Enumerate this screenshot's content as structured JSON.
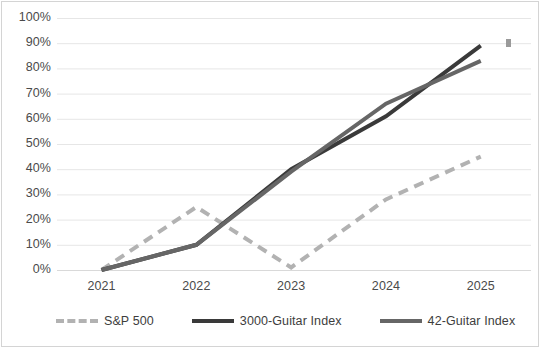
{
  "chart_data": {
    "type": "line",
    "title": "",
    "subtitle": "",
    "xlabel": "",
    "ylabel": "",
    "categories": [
      "2021",
      "2022",
      "2023",
      "2024",
      "2025"
    ],
    "ylim": [
      0,
      100
    ],
    "yticks": [
      "0%",
      "10%",
      "20%",
      "30%",
      "40%",
      "50%",
      "60%",
      "70%",
      "80%",
      "90%",
      "100%"
    ],
    "ytick_values": [
      0,
      10,
      20,
      30,
      40,
      50,
      60,
      70,
      80,
      90,
      100
    ],
    "grid": true,
    "legend_position": "bottom",
    "series": [
      {
        "name": "S&P 500",
        "values": [
          0,
          25,
          1,
          28,
          45
        ],
        "style": "dashed",
        "color": "#b2b2b2",
        "width": 4
      },
      {
        "name": "3000-Guitar Index",
        "values": [
          0,
          10,
          40,
          61,
          89
        ],
        "style": "solid",
        "color": "#3a3a3a",
        "width": 4
      },
      {
        "name": "42-Guitar Index",
        "values": [
          0,
          10,
          39,
          66,
          83
        ],
        "style": "solid",
        "color": "#666666",
        "width": 4
      }
    ],
    "annotations": [
      {
        "name": "stray-marker",
        "shape": "square",
        "color": "#9a9a9a",
        "x_px": 506,
        "y_value": 90
      }
    ]
  },
  "legend": {
    "items": [
      {
        "label": "S&P 500"
      },
      {
        "label": "3000-Guitar Index"
      },
      {
        "label": "42-Guitar Index"
      }
    ]
  },
  "colors": {
    "background": "#ffffff",
    "frame": "#d4d4d4",
    "gridline": "#e6e6e6",
    "axis": "#d9d9d9",
    "tick_text": "#4a4a4a",
    "series_sp500": "#b2b2b2",
    "series_3000": "#3a3a3a",
    "series_42": "#666666"
  }
}
